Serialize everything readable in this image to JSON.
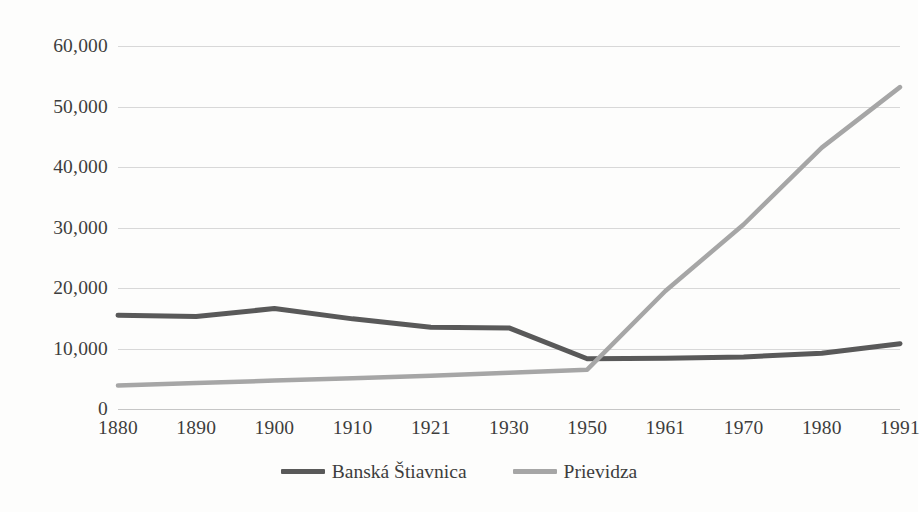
{
  "chart_data": {
    "type": "line",
    "title": "",
    "subtitle": "",
    "xlabel": "",
    "ylabel": "",
    "categories": [
      "1880",
      "1890",
      "1900",
      "1910",
      "1921",
      "1930",
      "1950",
      "1961",
      "1970",
      "1980",
      "1991"
    ],
    "ylim": [
      0,
      60000
    ],
    "ytick_values": [
      60000,
      50000,
      40000,
      30000,
      20000,
      10000,
      0
    ],
    "ytick_labels": [
      "60,000",
      "50,000",
      "40,000",
      "30,000",
      "20,000",
      "10,000",
      "0"
    ],
    "grid": true,
    "legend_position": "bottom",
    "series": [
      {
        "name": "Banská Štiavnica",
        "color": "#595959",
        "values": [
          15500,
          15300,
          16600,
          14900,
          13500,
          13400,
          8300,
          8400,
          8600,
          9200,
          10800
        ]
      },
      {
        "name": "Prievidza",
        "color": "#a6a6a6",
        "values": [
          3900,
          4300,
          4700,
          5100,
          5500,
          6000,
          6500,
          19500,
          30500,
          43200,
          53200
        ]
      }
    ]
  },
  "legend": {
    "items": [
      {
        "label": "Banská Štiavnica",
        "color": "#595959"
      },
      {
        "label": "Prievidza",
        "color": "#a6a6a6"
      }
    ]
  },
  "colors": {
    "background": "#fdfdfc",
    "gridline": "#d8d8d8",
    "text": "#3d3d3d",
    "series_banska": "#595959",
    "series_prievidza": "#a6a6a6"
  }
}
